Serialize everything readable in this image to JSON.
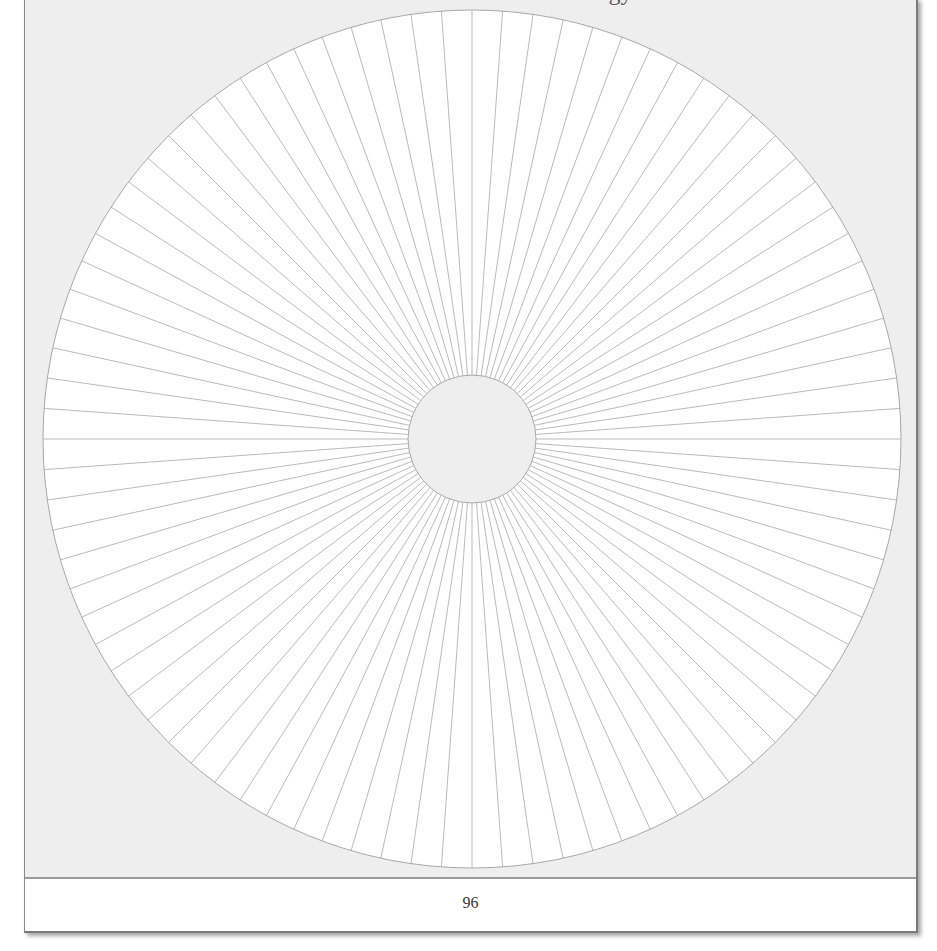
{
  "page": {
    "clipped_heading_fragment": "gy",
    "page_number": "96"
  },
  "diagram": {
    "type": "spoke-wheel",
    "spoke_count": 88,
    "center_x": 471,
    "center_y": 441,
    "outer_radius": 429,
    "inner_radius": 64,
    "colors": {
      "wheel_fill": "#ffffff",
      "inner_fill": "#eeeeee",
      "line": "#a8a8a8",
      "page_background": "#eeeeee"
    }
  }
}
